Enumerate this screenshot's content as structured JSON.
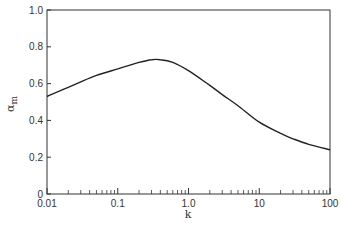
{
  "chart_data": {
    "type": "line",
    "title": "",
    "xlabel": "k",
    "ylabel": "α_m",
    "ylabel_main": "α",
    "ylabel_sub": "m",
    "xscale": "log",
    "xlim": [
      0.01,
      100
    ],
    "ylim": [
      0,
      1.0
    ],
    "grid": false,
    "legend": null,
    "x_ticks": [
      0.01,
      0.1,
      1.0,
      10,
      100
    ],
    "x_tick_labels": [
      "0.01",
      "0.1",
      "1.0",
      "10",
      "100"
    ],
    "y_ticks": [
      0,
      0.2,
      0.4,
      0.6,
      0.8,
      1.0
    ],
    "y_tick_labels": [
      "0",
      "0.2",
      "0.4",
      "0.6",
      "0.8",
      "1.0"
    ],
    "series": [
      {
        "name": "alpha_m",
        "color": "#222222",
        "x": [
          0.01,
          0.02,
          0.03,
          0.05,
          0.1,
          0.2,
          0.3,
          0.4,
          0.6,
          1.0,
          2.0,
          3.0,
          5.0,
          10,
          20,
          30,
          50,
          100
        ],
        "y": [
          0.53,
          0.58,
          0.61,
          0.645,
          0.68,
          0.715,
          0.73,
          0.73,
          0.715,
          0.67,
          0.59,
          0.54,
          0.48,
          0.39,
          0.33,
          0.3,
          0.27,
          0.24
        ]
      }
    ]
  }
}
